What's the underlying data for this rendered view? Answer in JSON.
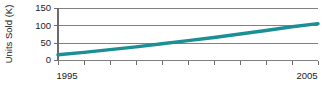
{
  "chart_data": {
    "type": "line",
    "title": "",
    "xlabel": "",
    "ylabel": "Units Sold (K)",
    "grid": true,
    "legend": false,
    "xlim": [
      1995,
      2005
    ],
    "ylim": [
      0,
      150
    ],
    "x": [
      1995,
      1996,
      1997,
      1998,
      1999,
      2000,
      2001,
      2002,
      2003,
      2004,
      2005
    ],
    "x_tick_labels": [
      "1995",
      "",
      "",
      "",
      "",
      "",
      "",
      "",
      "",
      "",
      "2005"
    ],
    "y_ticks": [
      0,
      50,
      100,
      150
    ],
    "y_tick_labels": [
      "0",
      "50",
      "100",
      "150"
    ],
    "series": [
      {
        "name": "Units Sold",
        "color": "#1a8f94",
        "values": [
          15,
          22,
          30,
          38,
          47,
          56,
          65,
          75,
          85,
          96,
          105
        ]
      }
    ]
  },
  "axis": {
    "y_label": "Units Sold (K)",
    "x_label_start": "1995",
    "x_label_end": "2005"
  },
  "colors": {
    "series": "#1a8f94",
    "grid": "#808080",
    "axis": "#6b6b6b",
    "text": "#1a1a1a",
    "background": "#ffffff"
  }
}
